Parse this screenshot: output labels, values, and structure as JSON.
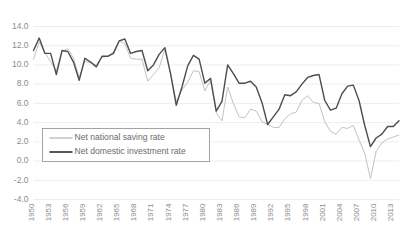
{
  "chart_data": {
    "type": "line",
    "title": "",
    "subtitle": "",
    "xlabel": "",
    "ylabel": "",
    "ylim": [
      -4.0,
      14.0
    ],
    "xlim": [
      1950,
      2014
    ],
    "grid": true,
    "legend_position": "lower-left-inside",
    "y_ticks": [
      "14.0",
      "12.0",
      "10.0",
      "8.0",
      "6.0",
      "4.0",
      "2.0",
      "0.0",
      "-2.0",
      "-4.0"
    ],
    "y_tick_values": [
      14.0,
      12.0,
      10.0,
      8.0,
      6.0,
      4.0,
      2.0,
      0.0,
      -2.0,
      -4.0
    ],
    "x_ticks": [
      "1950",
      "1953",
      "1956",
      "1959",
      "1962",
      "1965",
      "1968",
      "1971",
      "1974",
      "1977",
      "1980",
      "1983",
      "1986",
      "1989",
      "1992",
      "1995",
      "1998",
      "2001",
      "2004",
      "2007",
      "2010",
      "2013"
    ],
    "x_tick_values": [
      1950,
      1953,
      1956,
      1959,
      1962,
      1965,
      1968,
      1971,
      1974,
      1977,
      1980,
      1983,
      1986,
      1989,
      1992,
      1995,
      1998,
      2001,
      2004,
      2007,
      2010,
      2013
    ],
    "x": [
      1950,
      1951,
      1952,
      1953,
      1954,
      1955,
      1956,
      1957,
      1958,
      1959,
      1960,
      1961,
      1962,
      1963,
      1964,
      1965,
      1966,
      1967,
      1968,
      1969,
      1970,
      1971,
      1972,
      1973,
      1974,
      1975,
      1976,
      1977,
      1978,
      1979,
      1980,
      1981,
      1982,
      1983,
      1984,
      1985,
      1986,
      1987,
      1988,
      1989,
      1990,
      1991,
      1992,
      1993,
      1994,
      1995,
      1996,
      1997,
      1998,
      1999,
      2000,
      2001,
      2002,
      2003,
      2004,
      2005,
      2006,
      2007,
      2008,
      2009,
      2010,
      2011,
      2012,
      2013,
      2014
    ],
    "series": [
      {
        "name": "Net national saving rate",
        "color": "#c2c2c2",
        "width": 1.0,
        "values": [
          10.6,
          12.4,
          11.3,
          10.3,
          9.4,
          11.4,
          11.7,
          10.7,
          8.7,
          10.4,
          10.2,
          10.0,
          10.8,
          10.9,
          11.4,
          12.5,
          12.2,
          10.7,
          10.6,
          10.6,
          8.3,
          9.0,
          9.7,
          11.6,
          9.1,
          6.2,
          7.4,
          8.2,
          9.4,
          9.3,
          7.3,
          8.4,
          5.0,
          4.2,
          7.7,
          6.0,
          4.6,
          4.5,
          5.4,
          5.2,
          4.1,
          3.8,
          3.5,
          3.5,
          4.4,
          4.9,
          5.1,
          6.3,
          6.8,
          6.1,
          6.0,
          4.1,
          3.1,
          2.8,
          3.5,
          3.4,
          3.7,
          2.2,
          0.8,
          -1.8,
          1.0,
          1.9,
          2.3,
          2.5,
          2.7
        ]
      },
      {
        "name": "Net domestic investment rate",
        "color": "#4d4d4d",
        "width": 1.4,
        "values": [
          11.5,
          12.8,
          11.2,
          11.2,
          9.0,
          11.5,
          11.4,
          10.3,
          8.4,
          10.7,
          10.3,
          9.8,
          10.9,
          10.9,
          11.2,
          12.5,
          12.7,
          11.2,
          11.4,
          11.5,
          9.4,
          10.0,
          11.1,
          11.8,
          9.1,
          5.8,
          7.7,
          9.9,
          11.0,
          10.6,
          8.1,
          8.6,
          5.2,
          6.2,
          10.0,
          9.1,
          8.1,
          8.1,
          8.3,
          7.7,
          6.1,
          3.8,
          4.6,
          5.4,
          6.9,
          6.8,
          7.2,
          8.0,
          8.7,
          8.9,
          9.0,
          6.3,
          5.3,
          5.5,
          7.0,
          7.8,
          7.9,
          6.3,
          3.7,
          1.5,
          2.4,
          2.8,
          3.6,
          3.6,
          4.2
        ]
      }
    ]
  }
}
